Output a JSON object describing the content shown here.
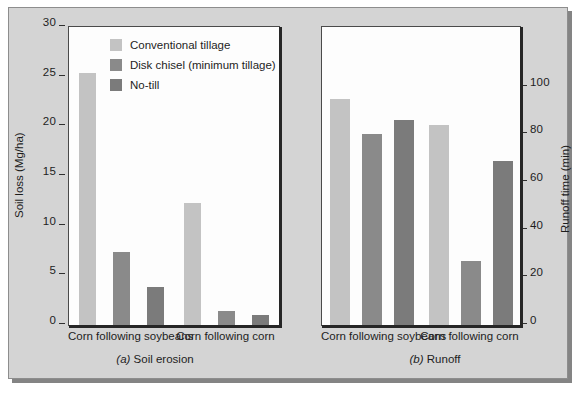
{
  "figure": {
    "background_color": "#d4d4d4",
    "plot_background_color": "#fdfdfd"
  },
  "legend": {
    "position": "top-left-of-panel-a",
    "items": [
      {
        "label": "Conventional tillage",
        "color": "#c3c3c3",
        "key": "conventional"
      },
      {
        "label": "Disk chisel (minimum tillage)",
        "color": "#8a8a8a",
        "key": "disk_chisel"
      },
      {
        "label": "No-till",
        "color": "#7b7b7b",
        "key": "no_till"
      }
    ]
  },
  "chart_data": [
    {
      "id": "a",
      "type": "bar",
      "title": "(a) Soil erosion",
      "caption_prefix": "(a)",
      "caption_text": "Soil erosion",
      "xlabel": "",
      "ylabel": "Soil loss (Mg/ha)",
      "ylim": [
        0,
        30
      ],
      "yticks": [
        0,
        5,
        10,
        15,
        20,
        25,
        30
      ],
      "ytick_labels": [
        "0",
        "5",
        "10",
        "15",
        "20",
        "25",
        "30"
      ],
      "grid": false,
      "legend_position": "inside top-right",
      "categories": [
        "Corn following soybeans",
        "Corn following corn"
      ],
      "series": [
        {
          "name": "Conventional tillage",
          "color": "#c3c3c3",
          "values": [
            25.4,
            12.3
          ]
        },
        {
          "name": "Disk chisel (minimum tillage)",
          "color": "#8a8a8a",
          "values": [
            7.4,
            1.4
          ]
        },
        {
          "name": "No-till",
          "color": "#7b7b7b",
          "values": [
            3.8,
            1.0
          ]
        }
      ]
    },
    {
      "id": "b",
      "type": "bar",
      "title": "(b) Runoff",
      "caption_prefix": "(b)",
      "caption_text": "Runoff",
      "xlabel": "",
      "ylabel": "Runoff time (min)",
      "ylim": [
        0,
        125
      ],
      "yticks": [
        0,
        20,
        40,
        60,
        80,
        100
      ],
      "ytick_labels": [
        "0",
        "20",
        "40",
        "60",
        "80",
        "100"
      ],
      "grid": false,
      "legend_position": "none",
      "categories": [
        "Corn following soybeans",
        "Corn following corn"
      ],
      "series": [
        {
          "name": "Conventional tillage",
          "color": "#c3c3c3",
          "values": [
            95,
            84
          ]
        },
        {
          "name": "Disk chisel (minimum tillage)",
          "color": "#8a8a8a",
          "values": [
            80,
            27
          ]
        },
        {
          "name": "No-till",
          "color": "#7b7b7b",
          "values": [
            86,
            69
          ]
        }
      ]
    }
  ]
}
